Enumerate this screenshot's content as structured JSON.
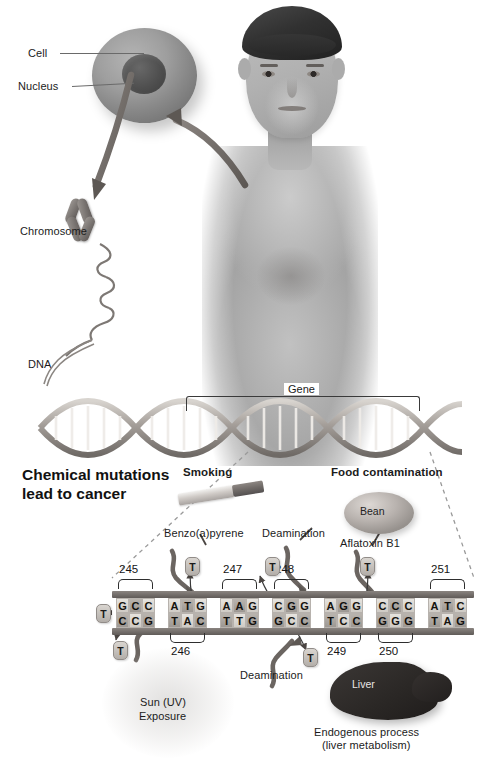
{
  "headline": "Chemical mutations\nlead to cancer",
  "anatomy_labels": {
    "cell": "Cell",
    "nucleus": "Nucleus",
    "chromosome": "Chromosome",
    "dna": "DNA",
    "gene": "Gene"
  },
  "causes": [
    {
      "id": "smoking",
      "title": "Smoking",
      "agent": "Benzo(a)pyrene",
      "icon": "cigarette-icon"
    },
    {
      "id": "deamination-1",
      "title": "",
      "agent": "Deamination",
      "icon": "squiggle-icon"
    },
    {
      "id": "food",
      "title": "Food contamination",
      "agent": "Aflatoxin B1",
      "icon": "bean-icon",
      "icon_label": "Bean"
    },
    {
      "id": "uv",
      "title": "",
      "agent": "Sun (UV)\nExposure",
      "icon": "sun-glow-icon"
    },
    {
      "id": "deamination-2",
      "title": "",
      "agent": "Deamination",
      "icon": "squiggle-icon"
    },
    {
      "id": "liver",
      "title": "",
      "agent": "Endogenous process\n(liver metabolism)",
      "icon": "liver-icon",
      "icon_label": "Liver"
    }
  ],
  "labels": {
    "smoking": "Smoking",
    "benzopyrene": "Benzo(a)pyrene",
    "deamination_top": "Deamination",
    "food_contamination": "Food contamination",
    "aflatoxin": "Aflatoxin B1",
    "bean": "Bean",
    "sun_uv": "Sun (UV)",
    "exposure": "Exposure",
    "deamination_bottom": "Deamination",
    "liver": "Liver",
    "endogenous_1": "Endogenous process",
    "endogenous_2": "(liver metabolism)"
  },
  "sequence": {
    "mutation_base": "T",
    "codons": [
      {
        "number": "245",
        "top": [
          "G",
          "C",
          "C"
        ],
        "bottom": [
          "C",
          "C",
          "G"
        ],
        "number_position": "above"
      },
      {
        "number": "246",
        "top": [
          "A",
          "T",
          "G"
        ],
        "bottom": [
          "T",
          "A",
          "C"
        ],
        "number_position": "below"
      },
      {
        "number": "247",
        "top": [
          "A",
          "A",
          "G"
        ],
        "bottom": [
          "T",
          "T",
          "G"
        ],
        "number_position": "above"
      },
      {
        "number": "248",
        "top": [
          "C",
          "G",
          "G"
        ],
        "bottom": [
          "G",
          "C",
          "C"
        ],
        "number_position": "above"
      },
      {
        "number": "249",
        "top": [
          "A",
          "G",
          "G"
        ],
        "bottom": [
          "T",
          "C",
          "C"
        ],
        "number_position": "below"
      },
      {
        "number": "250",
        "top": [
          "C",
          "C",
          "C"
        ],
        "bottom": [
          "G",
          "G",
          "G"
        ],
        "number_position": "below"
      },
      {
        "number": "251",
        "top": [
          "A",
          "T",
          "C"
        ],
        "bottom": [
          "T",
          "A",
          "G"
        ],
        "number_position": "above"
      }
    ],
    "mutation_chips_above": 3,
    "mutation_chips_below": 3
  },
  "colors": {
    "background": "#ffffff",
    "text": "#1a1a1a",
    "backbone": "#605b58",
    "base_light": "#e6e3de",
    "base_dark": "#b9b4ae",
    "arrow": "#6b6561",
    "dashed_line": "#9a9a9a"
  }
}
